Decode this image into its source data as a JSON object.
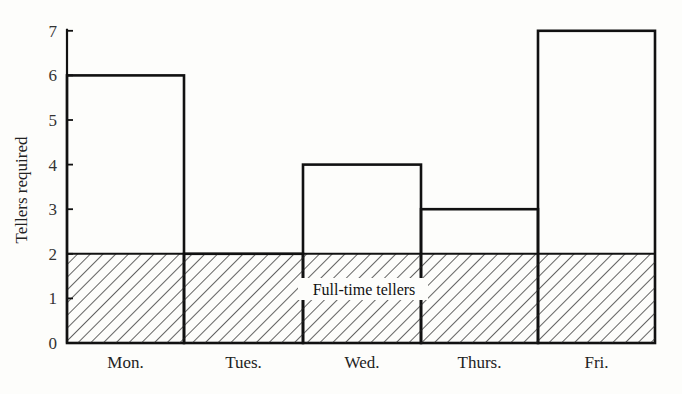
{
  "chart_data": {
    "type": "bar",
    "title": "",
    "xlabel": "",
    "ylabel": "Tellers required",
    "categories": [
      "Mon.",
      "Tues.",
      "Wed.",
      "Thurs.",
      "Fri."
    ],
    "values": [
      6,
      2,
      4,
      3,
      7
    ],
    "series": [
      {
        "name": "Tellers required",
        "values": [
          6,
          2,
          4,
          3,
          7
        ]
      },
      {
        "name": "Full-time tellers",
        "values": [
          2,
          2,
          2,
          2,
          2
        ],
        "style": "hatched"
      }
    ],
    "yticks": [
      "0",
      "1",
      "2",
      "3",
      "4",
      "5",
      "6",
      "7"
    ],
    "ylim": [
      0,
      7
    ],
    "grid": false,
    "annotations": [
      {
        "text": "Full-time tellers",
        "y": 1.2
      }
    ],
    "colors": {
      "stroke": "#111111",
      "hatch": "#222222",
      "background": "#fdfdfb"
    }
  }
}
